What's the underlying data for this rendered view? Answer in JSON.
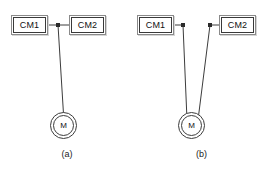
{
  "figure": {
    "background_color": "#ffffff",
    "line_color": "#3c3c3c",
    "box_border_color": "#3a3a3a",
    "box_shadow_color": "#d6d6d6",
    "text_color": "#111111"
  },
  "diagrams": [
    {
      "id": "a",
      "caption": "(a)",
      "description": "CM1 and CM2 joined by a horizontal link with a junction node; one vertical line descends from the node to the motor",
      "boxes": [
        {
          "id": "a-cm1",
          "label": "CM1"
        },
        {
          "id": "a-cm2",
          "label": "CM2"
        }
      ],
      "motor": {
        "id": "a-motor",
        "label": "M"
      },
      "nodes": [
        {
          "id": "a-junction",
          "x": 58,
          "y": 25
        }
      ],
      "links": [
        {
          "from": "a-cm1",
          "to": "a-junction",
          "x1": 48,
          "y1": 25,
          "x2": 58,
          "y2": 25
        },
        {
          "from": "a-junction",
          "to": "a-cm2",
          "x1": 58,
          "y1": 25,
          "x2": 69,
          "y2": 25
        },
        {
          "from": "a-junction",
          "to": "a-motor",
          "x1": 58,
          "y1": 25,
          "x2": 63.5,
          "y2": 112
        }
      ]
    },
    {
      "id": "b",
      "caption": "(b)",
      "description": "CM1 and CM2 each have their own node; two lines converge in a V down to a shared motor",
      "boxes": [
        {
          "id": "b-cm1",
          "label": "CM1"
        },
        {
          "id": "b-cm2",
          "label": "CM2"
        }
      ],
      "motor": {
        "id": "b-motor",
        "label": "M"
      },
      "nodes": [
        {
          "id": "b-node-left",
          "x": 49,
          "y": 25
        },
        {
          "id": "b-node-right",
          "x": 76,
          "y": 25
        }
      ],
      "links": [
        {
          "from": "b-cm1",
          "to": "b-node-left",
          "x1": 40,
          "y1": 25,
          "x2": 49,
          "y2": 25
        },
        {
          "from": "b-node-right",
          "to": "b-cm2",
          "x1": 76,
          "y1": 25,
          "x2": 85,
          "y2": 25
        },
        {
          "from": "b-node-left",
          "to": "b-motor",
          "x1": 49,
          "y1": 25,
          "x2": 52,
          "y2": 119
        },
        {
          "from": "b-node-right",
          "to": "b-motor",
          "x1": 76,
          "y1": 25,
          "x2": 63,
          "y2": 119
        }
      ]
    }
  ]
}
